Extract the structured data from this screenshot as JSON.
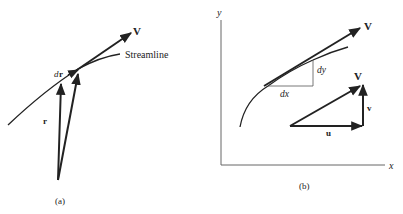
{
  "panel_a": {
    "caption": "(a)",
    "streamline_label": "Streamline",
    "velocity_label": "V",
    "dr_label_d": "d",
    "dr_label_r": "r",
    "position_label": "r"
  },
  "panel_b": {
    "caption": "(b)",
    "x_axis_label": "x",
    "y_axis_label": "y",
    "velocity_label": "V",
    "dx_label": "dx",
    "dy_label": "dy",
    "triangle": {
      "hypotenuse_label": "V",
      "horizontal_label": "u",
      "vertical_label": "v"
    }
  },
  "colors": {
    "ink": "#222222",
    "axis": "#666666",
    "background": "#ffffff"
  }
}
